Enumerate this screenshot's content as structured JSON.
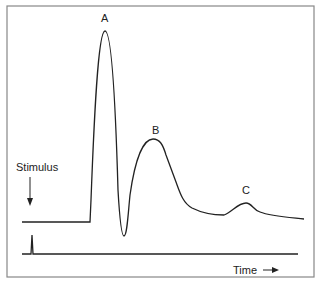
{
  "figure": {
    "peak_labels": {
      "a": "A",
      "b": "B",
      "c": "C"
    },
    "stimulus_label": "Stimulus",
    "time_label": "Time",
    "colors": {
      "line": "#222222",
      "frame": "#888888",
      "background": "#ffffff"
    }
  }
}
